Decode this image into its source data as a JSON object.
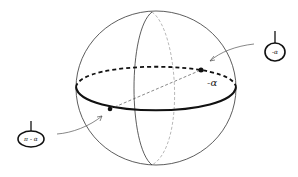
{
  "diagram": {
    "type": "sphere-diagram",
    "sphere": {
      "cx": 156,
      "cy": 88,
      "r": 80
    },
    "equator_label": "-α",
    "points": [
      {
        "name": "back-point",
        "x": 201,
        "y": 70
      },
      {
        "name": "front-point",
        "x": 110,
        "y": 109
      }
    ],
    "callouts": [
      {
        "name": "right-pin",
        "label": "-α"
      },
      {
        "name": "left-pin",
        "label": "π - α"
      }
    ],
    "colors": {
      "stroke": "#222222",
      "dashed": "#888888",
      "background": "#ffffff"
    }
  }
}
